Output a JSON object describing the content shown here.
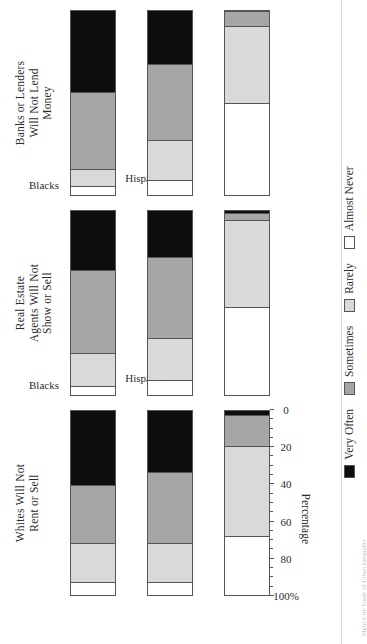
{
  "axis": {
    "value_axis_title": "Percentage",
    "tick_labels": [
      "100%",
      "80",
      "60",
      "40",
      "20",
      "0"
    ],
    "tick_values": [
      100,
      80,
      60,
      40,
      20,
      0
    ],
    "category_labels": [
      "Blacks",
      "Hispanics",
      "Asians"
    ]
  },
  "legend": {
    "items": [
      {
        "label": "Very Often",
        "color": "#0d0d0d",
        "key": "very_often"
      },
      {
        "label": "Sometimes",
        "color": "#a6a6a6",
        "key": "sometimes"
      },
      {
        "label": "Rarely",
        "color": "#d9d9d9",
        "key": "rarely"
      },
      {
        "label": "Almost Never",
        "color": "#ffffff",
        "key": "almost_never"
      }
    ]
  },
  "panels": [
    {
      "title": "Whites Will Not\nRent or Sell"
    },
    {
      "title": "Real Estate\nAgents Will Not\nShow or Sell"
    },
    {
      "title": "Banks or Lenders\nWill Not Lend\nMoney"
    }
  ],
  "caption": "Multi-City Study of Urban Inequality",
  "chart_data": {
    "type": "bar",
    "subtype": "stacked-horizontal-100",
    "title": "",
    "xlabel": "Percentage",
    "ylabel": "",
    "xlim": [
      0,
      100
    ],
    "grid": false,
    "legend_position": "bottom",
    "orientation": "horizontal",
    "categories": [
      "Blacks",
      "Hispanics",
      "Asians"
    ],
    "series_names": [
      "Very Often",
      "Sometimes",
      "Rarely",
      "Almost Never"
    ],
    "panels": [
      {
        "title": "Whites Will Not Rent or Sell",
        "series": [
          {
            "name": "Very Often",
            "values": [
              40,
              33,
              2
            ]
          },
          {
            "name": "Sometimes",
            "values": [
              32,
              39,
              17
            ]
          },
          {
            "name": "Rarely",
            "values": [
              21,
              21,
              49
            ]
          },
          {
            "name": "Almost Never",
            "values": [
              7,
              7,
              32
            ]
          }
        ]
      },
      {
        "title": "Real Estate Agents Will Not Show or Sell",
        "series": [
          {
            "name": "Very Often",
            "values": [
              32,
              25,
              1
            ]
          },
          {
            "name": "Sometimes",
            "values": [
              45,
              44,
              4
            ]
          },
          {
            "name": "Rarely",
            "values": [
              18,
              23,
              47
            ]
          },
          {
            "name": "Almost Never",
            "values": [
              5,
              8,
              48
            ]
          }
        ]
      },
      {
        "title": "Banks or Lenders Will Not Lend Money",
        "series": [
          {
            "name": "Very Often",
            "values": [
              44,
              29,
              0
            ]
          },
          {
            "name": "Sometimes",
            "values": [
              42,
              41,
              8
            ]
          },
          {
            "name": "Rarely",
            "values": [
              9,
              22,
              42
            ]
          },
          {
            "name": "Almost Never",
            "values": [
              5,
              8,
              50
            ]
          }
        ]
      }
    ]
  }
}
